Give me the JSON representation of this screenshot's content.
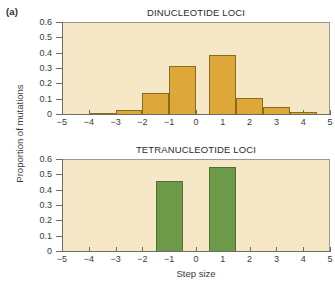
{
  "figure": {
    "panel_label": "(a)",
    "y_axis_label": "Proportion of mutations",
    "x_axis_label": "Step size"
  },
  "chart_data": [
    {
      "type": "bar",
      "title": "DINUCLEOTIDE LOCI",
      "xlabel": "Step size",
      "ylabel": "Proportion of mutations",
      "xlim": [
        -5,
        5
      ],
      "ylim": [
        0,
        0.6
      ],
      "grid": false,
      "legend": "none",
      "bar_color": "#dda73a",
      "bar_edge_color": "#8a6a1e",
      "plot_background": "#f6e7c6",
      "xticks": [
        -5,
        -4,
        -3,
        -2,
        -1,
        0,
        1,
        2,
        3,
        4,
        5
      ],
      "xtick_labels": [
        "−5",
        "−4",
        "−3",
        "−2",
        "−1",
        "0",
        "1",
        "2",
        "3",
        "4",
        "5"
      ],
      "yticks": [
        0,
        0.1,
        0.2,
        0.3,
        0.4,
        0.5,
        0.6
      ],
      "ytick_labels": [
        "0",
        "0.1",
        "0.2",
        "0.3",
        "0.4",
        "0.5",
        "0.6"
      ],
      "categories": [
        -4,
        -3,
        -2,
        -1,
        1,
        2,
        3,
        4
      ],
      "values": [
        0.005,
        0.025,
        0.14,
        0.31,
        0.385,
        0.105,
        0.045,
        0.01
      ],
      "bars": [
        {
          "center": -3.5,
          "value": 0.005
        },
        {
          "center": -2.5,
          "value": 0.025
        },
        {
          "center": -1.5,
          "value": 0.14
        },
        {
          "center": -0.5,
          "value": 0.31
        },
        {
          "center": 1.0,
          "value": 0.385
        },
        {
          "center": 2.0,
          "value": 0.105
        },
        {
          "center": 3.0,
          "value": 0.045
        },
        {
          "center": 4.0,
          "value": 0.01
        }
      ]
    },
    {
      "type": "bar",
      "title": "TETRANUCLEOTIDE LOCI",
      "xlabel": "Step size",
      "ylabel": "Proportion of mutations",
      "xlim": [
        -5,
        5
      ],
      "ylim": [
        0,
        0.6
      ],
      "grid": false,
      "legend": "none",
      "bar_color": "#6d9a48",
      "bar_edge_color": "#4d6f32",
      "plot_background": "#f6e7c6",
      "xticks": [
        -5,
        -4,
        -3,
        -2,
        -1,
        0,
        1,
        2,
        3,
        4,
        5
      ],
      "xtick_labels": [
        "−5",
        "−4",
        "−3",
        "−2",
        "−1",
        "0",
        "1",
        "2",
        "3",
        "4",
        "5"
      ],
      "yticks": [
        0,
        0.1,
        0.2,
        0.3,
        0.4,
        0.5,
        0.6
      ],
      "ytick_labels": [
        "0",
        "0.1",
        "0.2",
        "0.3",
        "0.4",
        "0.5",
        "0.6"
      ],
      "categories": [
        -1,
        1
      ],
      "values": [
        0.455,
        0.545
      ],
      "bars": [
        {
          "center": -1.0,
          "value": 0.455
        },
        {
          "center": 1.0,
          "value": 0.545
        }
      ]
    }
  ]
}
